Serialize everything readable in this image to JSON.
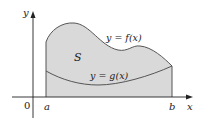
{
  "figure": {
    "axes": {
      "x_label": "x",
      "y_label": "y",
      "origin_label": "0"
    },
    "bounds": {
      "a_label": "a",
      "b_label": "b"
    },
    "region_label": "S",
    "curves": {
      "upper": {
        "label": "y = f(x)"
      },
      "lower": {
        "label": "y = g(x)"
      }
    },
    "colors": {
      "region_fill": "#d9d9d9",
      "curve_stroke": "#555555",
      "axis_stroke": "#222222"
    }
  }
}
